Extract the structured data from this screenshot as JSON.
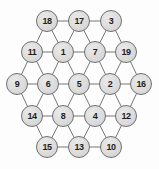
{
  "diagram": {
    "type": "hexagonal-node-graph",
    "canvas": {
      "width": 159,
      "height": 169
    },
    "style": {
      "background_color": "#fdfdfd",
      "node_fill_color": "#dcdcdc",
      "node_border_color": "#6f6f6f",
      "node_label_color": "#1d1d1d",
      "edge_color": "#767676",
      "node_radius": 11
    },
    "rows": [
      {
        "row_index": 0,
        "labels": [
          "18",
          "17",
          "3"
        ]
      },
      {
        "row_index": 1,
        "labels": [
          "11",
          "1",
          "7",
          "19"
        ]
      },
      {
        "row_index": 2,
        "labels": [
          "9",
          "6",
          "5",
          "2",
          "16"
        ]
      },
      {
        "row_index": 3,
        "labels": [
          "14",
          "8",
          "4",
          "12"
        ]
      },
      {
        "row_index": 4,
        "labels": [
          "15",
          "13",
          "10"
        ]
      }
    ],
    "nodes": [
      {
        "id": "n0",
        "label": "18",
        "x": 47,
        "y": 21
      },
      {
        "id": "n1",
        "label": "17",
        "x": 79,
        "y": 21
      },
      {
        "id": "n2",
        "label": "3",
        "x": 111,
        "y": 21
      },
      {
        "id": "n3",
        "label": "11",
        "x": 32,
        "y": 52
      },
      {
        "id": "n4",
        "label": "1",
        "x": 63,
        "y": 52
      },
      {
        "id": "n5",
        "label": "7",
        "x": 95,
        "y": 52
      },
      {
        "id": "n6",
        "label": "19",
        "x": 126,
        "y": 52
      },
      {
        "id": "n7",
        "label": "9",
        "x": 17,
        "y": 84
      },
      {
        "id": "n8",
        "label": "6",
        "x": 48,
        "y": 84
      },
      {
        "id": "n9",
        "label": "5",
        "x": 79,
        "y": 84
      },
      {
        "id": "n10",
        "label": "2",
        "x": 110,
        "y": 84
      },
      {
        "id": "n11",
        "label": "16",
        "x": 141,
        "y": 84
      },
      {
        "id": "n12",
        "label": "14",
        "x": 32,
        "y": 116
      },
      {
        "id": "n13",
        "label": "8",
        "x": 63,
        "y": 116
      },
      {
        "id": "n14",
        "label": "4",
        "x": 95,
        "y": 116
      },
      {
        "id": "n15",
        "label": "12",
        "x": 126,
        "y": 116
      },
      {
        "id": "n16",
        "label": "15",
        "x": 47,
        "y": 147
      },
      {
        "id": "n17",
        "label": "13",
        "x": 79,
        "y": 147
      },
      {
        "id": "n18",
        "label": "10",
        "x": 111,
        "y": 147
      }
    ],
    "edges": [
      [
        "n0",
        "n1"
      ],
      [
        "n1",
        "n2"
      ],
      [
        "n3",
        "n4"
      ],
      [
        "n4",
        "n5"
      ],
      [
        "n5",
        "n6"
      ],
      [
        "n7",
        "n8"
      ],
      [
        "n8",
        "n9"
      ],
      [
        "n9",
        "n10"
      ],
      [
        "n10",
        "n11"
      ],
      [
        "n12",
        "n13"
      ],
      [
        "n13",
        "n14"
      ],
      [
        "n14",
        "n15"
      ],
      [
        "n16",
        "n17"
      ],
      [
        "n17",
        "n18"
      ],
      [
        "n0",
        "n3"
      ],
      [
        "n0",
        "n4"
      ],
      [
        "n1",
        "n4"
      ],
      [
        "n1",
        "n5"
      ],
      [
        "n2",
        "n5"
      ],
      [
        "n2",
        "n6"
      ],
      [
        "n3",
        "n7"
      ],
      [
        "n3",
        "n8"
      ],
      [
        "n4",
        "n8"
      ],
      [
        "n4",
        "n9"
      ],
      [
        "n5",
        "n9"
      ],
      [
        "n5",
        "n10"
      ],
      [
        "n6",
        "n10"
      ],
      [
        "n6",
        "n11"
      ],
      [
        "n7",
        "n12"
      ],
      [
        "n8",
        "n12"
      ],
      [
        "n8",
        "n13"
      ],
      [
        "n9",
        "n13"
      ],
      [
        "n9",
        "n14"
      ],
      [
        "n10",
        "n14"
      ],
      [
        "n10",
        "n15"
      ],
      [
        "n11",
        "n15"
      ],
      [
        "n12",
        "n16"
      ],
      [
        "n13",
        "n16"
      ],
      [
        "n13",
        "n17"
      ],
      [
        "n14",
        "n17"
      ],
      [
        "n14",
        "n18"
      ],
      [
        "n15",
        "n18"
      ]
    ]
  }
}
